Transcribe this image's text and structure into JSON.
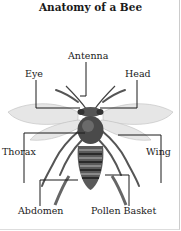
{
  "title": "Anatomy of a Bee",
  "labels": {
    "antenna": "Antenna",
    "eye": "Eye",
    "head": "Head",
    "thorax": "Thorax",
    "wing": "Wing",
    "abdomen": "Abdomen",
    "pollen_basket": "Pollen Basket"
  },
  "colors": {
    "line": "#1a1a1a",
    "wing": "#c8c8c8",
    "body": "#4a4a4a"
  }
}
